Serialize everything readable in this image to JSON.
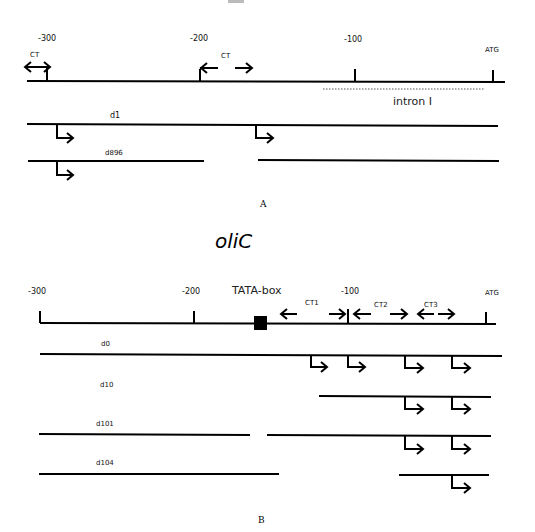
{
  "panel_a": {
    "title_fragment": "",
    "ticks": [
      "-300",
      "-200",
      "-100",
      "ATG"
    ],
    "ct_labels": [
      "CT",
      "CT"
    ],
    "intron_label": "intron I",
    "constructs": [
      "d1",
      "d896"
    ],
    "panel_label": "A"
  },
  "panel_b": {
    "title": "oliC",
    "ticks": [
      "-300",
      "-200",
      "-100",
      "ATG"
    ],
    "tata_label": "TATA-box",
    "ct_labels": [
      "CT1",
      "CT2",
      "CT3"
    ],
    "constructs": [
      "d0",
      "d10",
      "d101",
      "d104"
    ],
    "panel_label": "B"
  }
}
